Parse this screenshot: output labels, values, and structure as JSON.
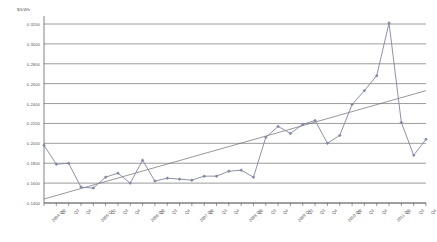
{
  "chart_data": {
    "type": "line",
    "title": "",
    "unit_label": "$/kWh",
    "xlabel": "",
    "ylabel": "",
    "ylim": [
      0.14,
      0.32
    ],
    "ytick_step": 0.02,
    "grid": true,
    "legend": false,
    "yticks": [
      "0.3200",
      "0.3000",
      "0.2800",
      "0.2600",
      "0.2400",
      "0.2200",
      "0.2000",
      "0.1800",
      "0.1600",
      "0.1400"
    ],
    "ytick_values": [
      0.32,
      0.3,
      0.28,
      0.26,
      0.24,
      0.22,
      0.2,
      0.18,
      0.16,
      0.14
    ],
    "categories": [
      "2004 Q1",
      "Q2",
      "Q3",
      "Q4",
      "2005 Q1",
      "Q2",
      "Q3",
      "Q4",
      "2006 Q1",
      "Q2",
      "Q3",
      "Q4",
      "2007 Q1",
      "Q2",
      "Q3",
      "Q4",
      "2008 Q1",
      "Q2",
      "Q3",
      "Q4",
      "2009 Q1",
      "Q2",
      "Q3",
      "Q4",
      "2010 Q1",
      "Q2",
      "Q3",
      "Q4",
      "2011 Q1",
      "Q2",
      "Q3",
      "Q4"
    ],
    "series": [
      {
        "name": "Price",
        "marker": "diamond",
        "color": "#7E86A8",
        "values": [
          0.198,
          0.179,
          0.18,
          0.156,
          0.155,
          0.166,
          0.17,
          0.16,
          0.183,
          0.162,
          0.165,
          0.164,
          0.163,
          0.167,
          0.167,
          0.172,
          0.173,
          0.166,
          0.206,
          0.217,
          0.21,
          0.219,
          0.223,
          0.2,
          0.208,
          0.239,
          0.253,
          0.268,
          0.321,
          0.221,
          0.188,
          0.204
        ]
      },
      {
        "name": "Linear trend",
        "type": "trendline",
        "color": "#6b6b6b",
        "start_value": 0.144,
        "end_value": 0.253
      }
    ],
    "series2_tail": {
      "note": "continuation of price series after trend",
      "values": [
        0.215,
        0.226,
        0.238,
        0.238,
        0.231,
        0.239,
        0.265,
        0.278,
        0.274
      ]
    }
  },
  "axes": {
    "y_axis_name": "value-axis",
    "x_axis_name": "category-axis"
  }
}
